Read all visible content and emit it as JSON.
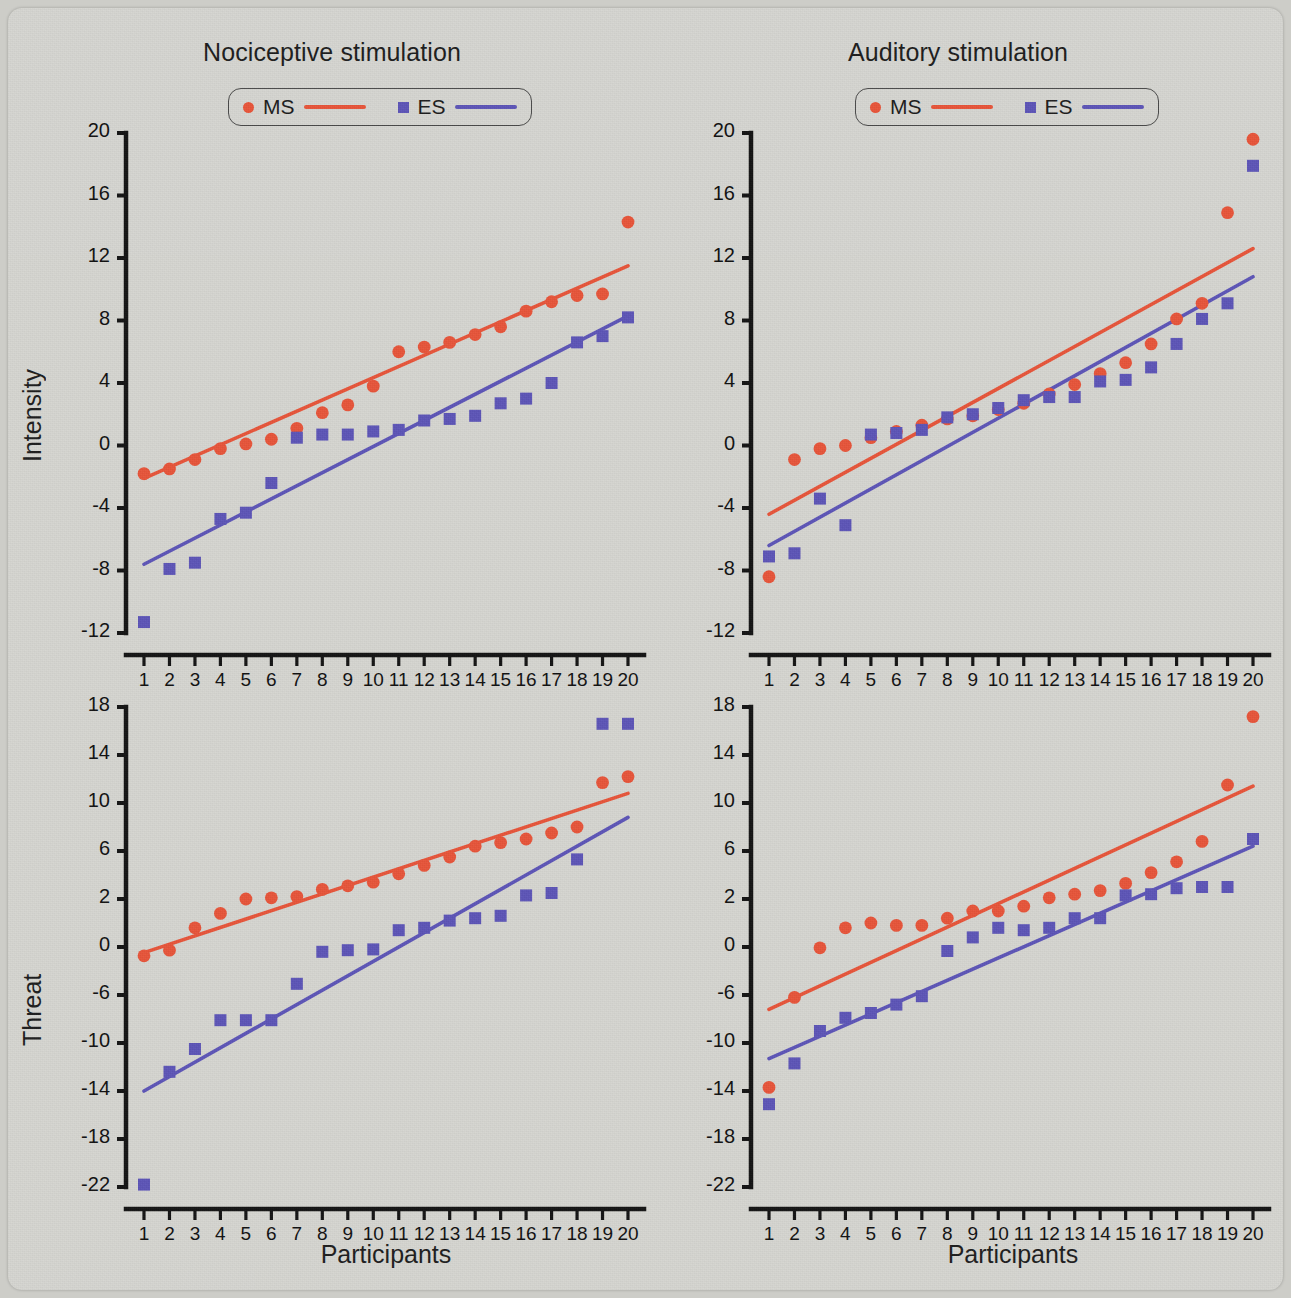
{
  "figure": {
    "background_color": "#d6d6d1",
    "series_colors": {
      "MS": "#e8553a",
      "ES": "#5d55b8"
    }
  },
  "legend": {
    "ms_label": "MS",
    "es_label": "ES"
  },
  "axis_labels": {
    "y_top": "Intensity",
    "y_bottom": "Threat",
    "x": "Participants"
  },
  "x_tick_labels": [
    "1",
    "2",
    "3",
    "4",
    "5",
    "6",
    "7",
    "8",
    "9",
    "10",
    "11",
    "12",
    "13",
    "14",
    "15",
    "16",
    "17",
    "18",
    "19",
    "20"
  ],
  "y_tick_labels_top": [
    "20",
    "16",
    "12",
    "8",
    "4",
    "0",
    "-4",
    "-8",
    "-12"
  ],
  "y_tick_labels_bottom": [
    "18",
    "14",
    "10",
    "6",
    "2",
    "0",
    "-6",
    "-10",
    "-14",
    "-18",
    "-22"
  ],
  "chart_data": [
    {
      "id": "nociceptive-intensity",
      "type": "scatter",
      "title": "Nociceptive stimulation",
      "xlabel": "Participants",
      "ylabel": "Intensity",
      "xlim": [
        1,
        20
      ],
      "ylim": [
        -12,
        20
      ],
      "yticks": [
        20,
        16,
        12,
        8,
        4,
        0,
        -4,
        -8,
        -12
      ],
      "grid": false,
      "legend_position": "top-center",
      "x": [
        1,
        2,
        3,
        4,
        5,
        6,
        7,
        8,
        9,
        10,
        11,
        12,
        13,
        14,
        15,
        16,
        17,
        18,
        19,
        20
      ],
      "series": [
        {
          "name": "MS",
          "marker": "circle",
          "color": "#e8553a",
          "values": [
            -1.8,
            -1.5,
            -0.9,
            -0.2,
            0.1,
            0.4,
            1.1,
            2.1,
            2.6,
            3.8,
            6.0,
            6.3,
            6.6,
            7.1,
            7.6,
            8.6,
            9.2,
            9.6,
            9.7,
            14.3
          ],
          "fit_line": {
            "x0": 1,
            "y0": -2.1,
            "x1": 20,
            "y1": 11.5
          }
        },
        {
          "name": "ES",
          "marker": "square",
          "color": "#5d55b8",
          "values": [
            -11.3,
            -7.9,
            -7.5,
            -4.7,
            -4.3,
            -2.4,
            0.5,
            0.7,
            0.7,
            0.9,
            1.0,
            1.6,
            1.7,
            1.9,
            2.7,
            3.0,
            4.0,
            6.6,
            7.0,
            8.2
          ],
          "fit_line": {
            "x0": 1,
            "y0": -7.6,
            "x1": 20,
            "y1": 8.3
          }
        }
      ]
    },
    {
      "id": "auditory-intensity",
      "type": "scatter",
      "title": "Auditory stimulation",
      "xlabel": "Participants",
      "ylabel": "Intensity",
      "xlim": [
        1,
        20
      ],
      "ylim": [
        -12,
        20
      ],
      "yticks": [
        20,
        16,
        12,
        8,
        4,
        0,
        -4,
        -8,
        -12
      ],
      "grid": false,
      "legend_position": "top-center",
      "x": [
        1,
        2,
        3,
        4,
        5,
        6,
        7,
        8,
        9,
        10,
        11,
        12,
        13,
        14,
        15,
        16,
        17,
        18,
        19,
        20
      ],
      "series": [
        {
          "name": "MS",
          "marker": "circle",
          "color": "#e8553a",
          "values": [
            -8.4,
            -0.9,
            -0.2,
            0.0,
            0.5,
            0.9,
            1.3,
            1.7,
            1.9,
            2.3,
            2.7,
            3.3,
            3.9,
            4.6,
            5.3,
            6.5,
            8.1,
            9.1,
            14.9,
            19.6
          ],
          "fit_line": {
            "x0": 1,
            "y0": -4.4,
            "x1": 20,
            "y1": 12.6
          }
        },
        {
          "name": "ES",
          "marker": "square",
          "color": "#5d55b8",
          "values": [
            -7.1,
            -6.9,
            -3.4,
            -5.1,
            0.7,
            0.8,
            1.0,
            1.8,
            2.0,
            2.4,
            2.9,
            3.1,
            3.1,
            4.1,
            4.2,
            5.0,
            6.5,
            8.1,
            9.1,
            17.9
          ],
          "fit_line": {
            "x0": 1,
            "y0": -6.4,
            "x1": 20,
            "y1": 10.8
          }
        }
      ]
    },
    {
      "id": "nociceptive-threat",
      "type": "scatter",
      "title": "Nociceptive stimulation",
      "xlabel": "Participants",
      "ylabel": "Threat",
      "xlim": [
        1,
        20
      ],
      "ylim": [
        -22,
        18
      ],
      "yticks": [
        18,
        14,
        10,
        6,
        2,
        0,
        -6,
        -10,
        -14,
        -18,
        -22
      ],
      "grid": false,
      "legend_position": "none",
      "x": [
        1,
        2,
        3,
        4,
        5,
        6,
        7,
        8,
        9,
        10,
        11,
        12,
        13,
        14,
        15,
        16,
        17,
        18,
        19,
        20
      ],
      "series": [
        {
          "name": "MS",
          "marker": "circle",
          "color": "#e8553a",
          "values": [
            -1.1,
            -0.4,
            0.8,
            1.4,
            2.0,
            2.1,
            2.2,
            2.8,
            3.1,
            3.4,
            4.1,
            4.8,
            5.5,
            6.4,
            6.7,
            7.0,
            7.5,
            8.0,
            11.7,
            12.2
          ],
          "fit_line": {
            "x0": 1,
            "y0": -0.7,
            "x1": 20,
            "y1": 10.8
          }
        },
        {
          "name": "ES",
          "marker": "square",
          "color": "#5d55b8",
          "values": [
            -21.8,
            -12.4,
            -10.5,
            -8.1,
            -8.1,
            -8.1,
            -4.6,
            -0.6,
            -0.4,
            -0.3,
            0.7,
            0.8,
            1.1,
            1.2,
            1.3,
            2.3,
            2.5,
            5.3,
            16.6,
            16.6
          ],
          "fit_line": {
            "x0": 1,
            "y0": -14.0,
            "x1": 20,
            "y1": 8.8
          }
        }
      ]
    },
    {
      "id": "auditory-threat",
      "type": "scatter",
      "title": "Auditory stimulation",
      "xlabel": "Participants",
      "ylabel": "Threat",
      "xlim": [
        -22,
        18
      ],
      "ylim": [
        -22,
        18
      ],
      "yticks": [
        18,
        14,
        10,
        6,
        2,
        0,
        -6,
        -10,
        -14,
        -18,
        -22
      ],
      "grid": false,
      "legend_position": "none",
      "x": [
        1,
        2,
        3,
        4,
        5,
        6,
        7,
        8,
        9,
        10,
        11,
        12,
        13,
        14,
        15,
        16,
        17,
        18,
        19,
        20
      ],
      "series": [
        {
          "name": "MS",
          "marker": "circle",
          "color": "#e8553a",
          "values": [
            -13.7,
            -6.2,
            -0.1,
            0.8,
            1.0,
            0.9,
            0.9,
            1.2,
            1.5,
            1.5,
            1.7,
            2.1,
            2.4,
            2.7,
            3.3,
            4.2,
            5.1,
            6.8,
            11.5,
            17.2
          ],
          "fit_line": {
            "x0": 1,
            "y0": -7.2,
            "x1": 20,
            "y1": 11.4
          }
        },
        {
          "name": "ES",
          "marker": "square",
          "color": "#5d55b8",
          "values": [
            -15.1,
            -11.7,
            -9.0,
            -7.9,
            -7.5,
            -6.8,
            -6.1,
            -0.5,
            0.4,
            0.8,
            0.7,
            0.8,
            1.2,
            1.2,
            2.3,
            2.4,
            2.9,
            3.0,
            3.0,
            7.0
          ],
          "fit_line": {
            "x0": 1,
            "y0": -11.3,
            "x1": 20,
            "y1": 6.4
          }
        }
      ]
    }
  ]
}
